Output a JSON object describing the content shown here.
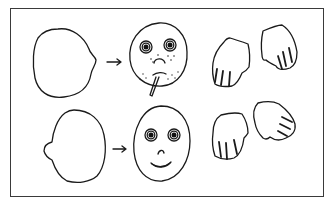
{
  "figure": {
    "rows": [
      {
        "name": "top-row",
        "blank_head": "outline-head-facing-right",
        "arrow": "→",
        "face": {
          "expression": "sad",
          "eyes": "round-eyes",
          "mouth": "frown",
          "features": [
            "freckles",
            "cigarette"
          ]
        },
        "hands": [
          "left-hand-fingers-down",
          "right-hand-tilted"
        ]
      },
      {
        "name": "bottom-row",
        "blank_head": "outline-head-facing-left",
        "arrow": "→",
        "face": {
          "expression": "happy",
          "eyes": "round-eyes",
          "mouth": "smile",
          "features": [
            "nose"
          ]
        },
        "hands": [
          "left-hand-fingers-down",
          "right-hand-tilted"
        ]
      }
    ],
    "colors": {
      "ink": "#1a1a1a",
      "frame": "#3a3a3a",
      "background": "#ffffff"
    }
  }
}
